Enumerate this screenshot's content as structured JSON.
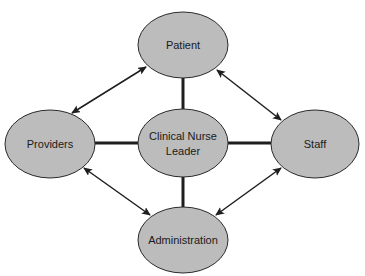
{
  "diagram": {
    "colors": {
      "node_fill": "#bcbcbc",
      "node_stroke": "#2a2a2a",
      "connector": "#1e1e1e",
      "background": "#ffffff"
    },
    "nodes": {
      "patient": {
        "label": "Patient",
        "cx": 183,
        "cy": 45,
        "rx": 45,
        "ry": 33
      },
      "providers": {
        "label": "Providers",
        "cx": 50,
        "cy": 144,
        "rx": 45,
        "ry": 34
      },
      "center": {
        "label_line1": "Clinical Nurse",
        "label_line2": "Leader",
        "cx": 183,
        "cy": 143,
        "rx": 45,
        "ry": 34
      },
      "staff": {
        "label": "Staff",
        "cx": 315,
        "cy": 144,
        "rx": 44,
        "ry": 34
      },
      "administration": {
        "label": "Administration",
        "cx": 183,
        "cy": 240,
        "rx": 45,
        "ry": 33
      }
    },
    "edges": [
      {
        "type": "line",
        "from": "center",
        "to": "patient"
      },
      {
        "type": "line",
        "from": "center",
        "to": "providers"
      },
      {
        "type": "line",
        "from": "center",
        "to": "staff"
      },
      {
        "type": "line",
        "from": "center",
        "to": "administration"
      },
      {
        "type": "double-arrow",
        "from": "providers",
        "to": "patient"
      },
      {
        "type": "double-arrow",
        "from": "patient",
        "to": "staff"
      },
      {
        "type": "double-arrow",
        "from": "providers",
        "to": "administration"
      },
      {
        "type": "double-arrow",
        "from": "administration",
        "to": "staff"
      }
    ]
  }
}
